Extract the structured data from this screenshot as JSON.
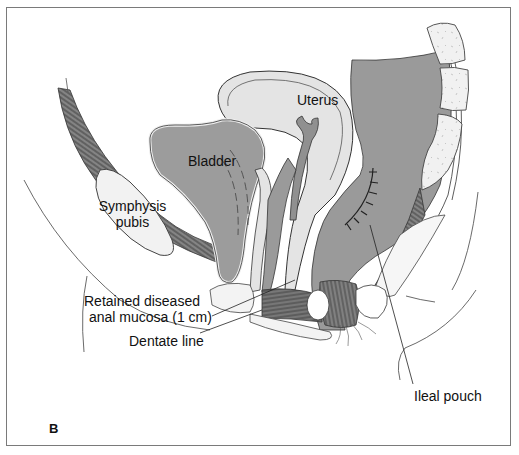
{
  "figure": {
    "panel_label": "B",
    "colors": {
      "organ_fill": "#9a9a9a",
      "light_fill": "#e4e4e4",
      "bone_fill": "#efefef",
      "muscle_fill": "#6e6e6e",
      "outline": "#222222",
      "frame": "#7a7a7a"
    }
  },
  "labels": {
    "uterus": "Uterus",
    "bladder": "Bladder",
    "symphysis_line1": "Symphysis",
    "symphysis_line2": "pubis",
    "retained_line1": "Retained diseased",
    "retained_line2": "anal mucosa (1 cm)",
    "dentate": "Dentate line",
    "ileal_pouch": "Ileal pouch"
  }
}
